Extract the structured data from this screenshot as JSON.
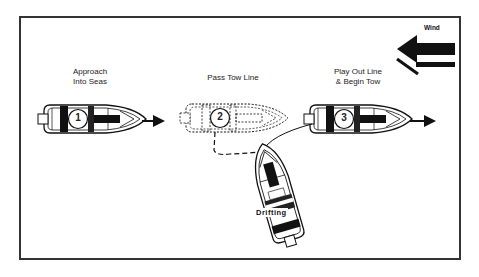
{
  "diagram": {
    "wind": {
      "label": "Wind",
      "direction": "left"
    },
    "steps": [
      {
        "number": "1",
        "label_line1": "Approach",
        "label_line2": "Into Seas",
        "style": "solid"
      },
      {
        "number": "2",
        "label_line1": "Pass Tow Line",
        "label_line2": "",
        "style": "dashed"
      },
      {
        "number": "3",
        "label_line1": "Play Out Line",
        "label_line2": "& Begin Tow",
        "style": "solid"
      }
    ],
    "drifting_boat": {
      "label": "Drifting"
    },
    "colors": {
      "ink": "#111111",
      "frame": "#333333",
      "background": "#ffffff"
    }
  }
}
